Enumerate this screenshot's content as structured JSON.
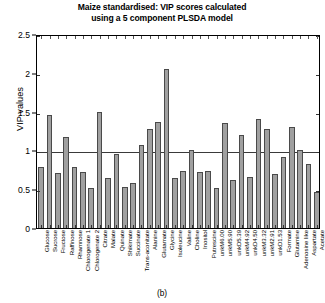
{
  "caption": "(b)",
  "chart_data": {
    "type": "bar",
    "title": "Maize standardised: VIP scores calculated using a 5 component PLSDA model",
    "title_lines": [
      "Maize standardised: VIP scores calculated",
      "using a 5 component PLSDA model"
    ],
    "xlabel": "",
    "ylabel": "VIP values",
    "ylim": [
      0,
      2.5
    ],
    "ytick_labels": [
      "0",
      "0.5",
      "1",
      "1.5",
      "2",
      "2.5"
    ],
    "ytick_values": [
      0,
      0.5,
      1,
      1.5,
      2,
      2.5
    ],
    "grid": false,
    "legend": null,
    "threshold_line": 1.0,
    "bar_color": "#a0a0a0",
    "bar_edge_color": "#4a4a4a",
    "categories": [
      "Glucose",
      "Sucrose",
      "Fructose",
      "Raffinose",
      "Rhamnose",
      "Chlorogenate 1",
      "Chlorogenate 2",
      "Citrate",
      "Malate",
      "Quinate",
      "Shikimate",
      "Succinate",
      "Trans-aconitate",
      "Alanine",
      "Glutamate",
      "Glycine",
      "Isoleucine",
      "Valine",
      "Choline",
      "Inositol",
      "Putrescine",
      "unkM6.00",
      "unkM5.90",
      "unkD5.39",
      "unkM4.92",
      "unkD4.50",
      "unkM3.32",
      "unkM2.91",
      "unkD1.53",
      "Formate",
      "Glutamine",
      "Adenosine like",
      "Aspartate",
      "Acetate"
    ],
    "values": [
      0.78,
      1.45,
      0.71,
      1.17,
      0.79,
      0.72,
      0.52,
      1.5,
      0.65,
      0.95,
      0.53,
      0.58,
      1.07,
      1.28,
      1.36,
      2.05,
      0.64,
      0.73,
      1.01,
      0.72,
      0.74,
      0.52,
      1.35,
      0.62,
      1.2,
      0.66,
      1.4,
      1.27,
      0.7,
      0.91,
      1.3,
      1.0,
      0.83,
      0.47
    ]
  }
}
